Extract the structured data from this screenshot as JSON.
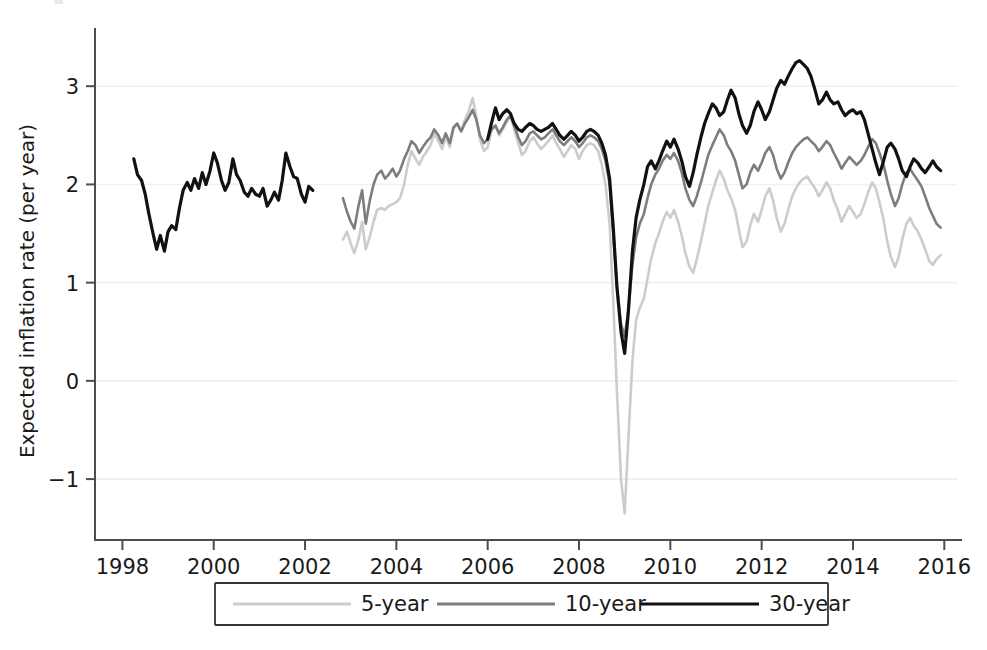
{
  "chart_data": {
    "type": "line",
    "title": "",
    "xlabel": "",
    "ylabel": "Expected inflation rate (per year)",
    "xlim": [
      1997.4,
      2016.3
    ],
    "ylim": [
      -1.62,
      3.45
    ],
    "xticks": [
      1998,
      2000,
      2002,
      2004,
      2006,
      2008,
      2010,
      2012,
      2014,
      2016
    ],
    "xticklabels": [
      "1998",
      "2000",
      "2002",
      "2004",
      "2006",
      "2008",
      "2010",
      "2012",
      "2014",
      "2016"
    ],
    "yticks": [
      -1,
      0,
      1,
      2,
      3
    ],
    "yticklabels": [
      "−1",
      "0",
      "1",
      "2",
      "3"
    ],
    "grid": "horizontal",
    "legend_position": "below-axes",
    "series": [
      {
        "name": "5-year",
        "color": "#cccccc",
        "width": 2.6,
        "x": [
          2002.83,
          2002.92,
          2003.0,
          2003.08,
          2003.17,
          2003.25,
          2003.33,
          2003.42,
          2003.5,
          2003.58,
          2003.67,
          2003.75,
          2003.83,
          2003.92,
          2004.0,
          2004.08,
          2004.17,
          2004.25,
          2004.33,
          2004.42,
          2004.5,
          2004.58,
          2004.67,
          2004.75,
          2004.83,
          2004.92,
          2005.0,
          2005.08,
          2005.17,
          2005.25,
          2005.33,
          2005.42,
          2005.5,
          2005.58,
          2005.67,
          2005.75,
          2005.83,
          2005.92,
          2006.0,
          2006.08,
          2006.17,
          2006.25,
          2006.33,
          2006.42,
          2006.5,
          2006.58,
          2006.67,
          2006.75,
          2006.83,
          2006.92,
          2007.0,
          2007.08,
          2007.17,
          2007.25,
          2007.33,
          2007.42,
          2007.5,
          2007.58,
          2007.67,
          2007.75,
          2007.83,
          2007.92,
          2008.0,
          2008.08,
          2008.17,
          2008.25,
          2008.33,
          2008.42,
          2008.5,
          2008.58,
          2008.67,
          2008.75,
          2008.83,
          2008.92,
          2009.0,
          2009.08,
          2009.17,
          2009.25,
          2009.33,
          2009.42,
          2009.5,
          2009.58,
          2009.67,
          2009.75,
          2009.83,
          2009.92,
          2010.0,
          2010.08,
          2010.17,
          2010.25,
          2010.33,
          2010.42,
          2010.5,
          2010.58,
          2010.67,
          2010.75,
          2010.83,
          2010.92,
          2011.0,
          2011.08,
          2011.17,
          2011.25,
          2011.33,
          2011.42,
          2011.5,
          2011.58,
          2011.67,
          2011.75,
          2011.83,
          2011.92,
          2012.0,
          2012.08,
          2012.17,
          2012.25,
          2012.33,
          2012.42,
          2012.5,
          2012.58,
          2012.67,
          2012.75,
          2012.83,
          2012.92,
          2013.0,
          2013.08,
          2013.17,
          2013.25,
          2013.33,
          2013.42,
          2013.5,
          2013.58,
          2013.67,
          2013.75,
          2013.83,
          2013.92,
          2014.0,
          2014.08,
          2014.17,
          2014.25,
          2014.33,
          2014.42,
          2014.5,
          2014.58,
          2014.67,
          2014.75,
          2014.83,
          2014.92,
          2015.0,
          2015.08,
          2015.17,
          2015.25,
          2015.33,
          2015.42,
          2015.5,
          2015.58,
          2015.67,
          2015.75,
          2015.83,
          2015.92
        ],
        "y": [
          1.44,
          1.52,
          1.4,
          1.3,
          1.44,
          1.62,
          1.34,
          1.47,
          1.62,
          1.74,
          1.76,
          1.74,
          1.78,
          1.8,
          1.82,
          1.86,
          2.0,
          2.2,
          2.34,
          2.26,
          2.2,
          2.28,
          2.34,
          2.4,
          2.52,
          2.44,
          2.36,
          2.48,
          2.38,
          2.56,
          2.62,
          2.54,
          2.66,
          2.74,
          2.88,
          2.7,
          2.46,
          2.34,
          2.38,
          2.54,
          2.6,
          2.5,
          2.56,
          2.64,
          2.7,
          2.56,
          2.42,
          2.3,
          2.34,
          2.44,
          2.48,
          2.42,
          2.36,
          2.4,
          2.44,
          2.5,
          2.42,
          2.36,
          2.28,
          2.34,
          2.4,
          2.36,
          2.26,
          2.34,
          2.4,
          2.42,
          2.4,
          2.34,
          2.2,
          2.0,
          1.6,
          0.8,
          -0.1,
          -1.0,
          -1.35,
          -0.6,
          0.2,
          0.62,
          0.74,
          0.84,
          1.04,
          1.24,
          1.4,
          1.5,
          1.62,
          1.72,
          1.66,
          1.74,
          1.62,
          1.48,
          1.3,
          1.16,
          1.1,
          1.24,
          1.42,
          1.6,
          1.78,
          1.92,
          2.04,
          2.14,
          2.06,
          1.94,
          1.86,
          1.74,
          1.54,
          1.36,
          1.42,
          1.58,
          1.7,
          1.62,
          1.74,
          1.88,
          1.96,
          1.84,
          1.66,
          1.52,
          1.6,
          1.74,
          1.88,
          1.96,
          2.02,
          2.06,
          2.08,
          2.02,
          1.96,
          1.88,
          1.94,
          2.02,
          1.96,
          1.84,
          1.74,
          1.62,
          1.7,
          1.78,
          1.72,
          1.66,
          1.7,
          1.8,
          1.92,
          2.02,
          1.96,
          1.82,
          1.64,
          1.42,
          1.26,
          1.16,
          1.26,
          1.44,
          1.6,
          1.66,
          1.58,
          1.52,
          1.44,
          1.34,
          1.22,
          1.18,
          1.24,
          1.28
        ]
      },
      {
        "name": "10-year",
        "color": "#7d7d7d",
        "width": 2.6,
        "x": [
          2002.83,
          2002.92,
          2003.0,
          2003.08,
          2003.17,
          2003.25,
          2003.33,
          2003.42,
          2003.5,
          2003.58,
          2003.67,
          2003.75,
          2003.83,
          2003.92,
          2004.0,
          2004.08,
          2004.17,
          2004.25,
          2004.33,
          2004.42,
          2004.5,
          2004.58,
          2004.67,
          2004.75,
          2004.83,
          2004.92,
          2005.0,
          2005.08,
          2005.17,
          2005.25,
          2005.33,
          2005.42,
          2005.5,
          2005.58,
          2005.67,
          2005.75,
          2005.83,
          2005.92,
          2006.0,
          2006.08,
          2006.17,
          2006.25,
          2006.33,
          2006.42,
          2006.5,
          2006.58,
          2006.67,
          2006.75,
          2006.83,
          2006.92,
          2007.0,
          2007.08,
          2007.17,
          2007.25,
          2007.33,
          2007.42,
          2007.5,
          2007.58,
          2007.67,
          2007.75,
          2007.83,
          2007.92,
          2008.0,
          2008.08,
          2008.17,
          2008.25,
          2008.33,
          2008.42,
          2008.5,
          2008.58,
          2008.67,
          2008.75,
          2008.83,
          2008.92,
          2009.0,
          2009.08,
          2009.17,
          2009.25,
          2009.33,
          2009.42,
          2009.5,
          2009.58,
          2009.67,
          2009.75,
          2009.83,
          2009.92,
          2010.0,
          2010.08,
          2010.17,
          2010.25,
          2010.33,
          2010.42,
          2010.5,
          2010.58,
          2010.67,
          2010.75,
          2010.83,
          2010.92,
          2011.0,
          2011.08,
          2011.17,
          2011.25,
          2011.33,
          2011.42,
          2011.5,
          2011.58,
          2011.67,
          2011.75,
          2011.83,
          2011.92,
          2012.0,
          2012.08,
          2012.17,
          2012.25,
          2012.33,
          2012.42,
          2012.5,
          2012.58,
          2012.67,
          2012.75,
          2012.83,
          2012.92,
          2013.0,
          2013.08,
          2013.17,
          2013.25,
          2013.33,
          2013.42,
          2013.5,
          2013.58,
          2013.67,
          2013.75,
          2013.83,
          2013.92,
          2014.0,
          2014.08,
          2014.17,
          2014.25,
          2014.33,
          2014.42,
          2014.5,
          2014.58,
          2014.67,
          2014.75,
          2014.83,
          2014.92,
          2015.0,
          2015.08,
          2015.17,
          2015.25,
          2015.33,
          2015.42,
          2015.5,
          2015.58,
          2015.67,
          2015.75,
          2015.83,
          2015.92
        ],
        "y": [
          1.86,
          1.72,
          1.62,
          1.55,
          1.78,
          1.94,
          1.6,
          1.84,
          2.0,
          2.1,
          2.14,
          2.06,
          2.1,
          2.16,
          2.08,
          2.14,
          2.26,
          2.34,
          2.44,
          2.4,
          2.32,
          2.38,
          2.44,
          2.48,
          2.56,
          2.5,
          2.42,
          2.52,
          2.42,
          2.58,
          2.62,
          2.54,
          2.62,
          2.68,
          2.76,
          2.66,
          2.5,
          2.42,
          2.46,
          2.56,
          2.6,
          2.52,
          2.58,
          2.66,
          2.7,
          2.6,
          2.48,
          2.4,
          2.44,
          2.52,
          2.54,
          2.5,
          2.46,
          2.48,
          2.52,
          2.56,
          2.5,
          2.44,
          2.4,
          2.44,
          2.48,
          2.44,
          2.38,
          2.42,
          2.48,
          2.5,
          2.48,
          2.44,
          2.36,
          2.24,
          2.0,
          1.5,
          0.96,
          0.58,
          0.45,
          0.72,
          1.18,
          1.46,
          1.6,
          1.7,
          1.86,
          2.0,
          2.1,
          2.16,
          2.24,
          2.3,
          2.26,
          2.32,
          2.24,
          2.12,
          1.96,
          1.84,
          1.78,
          1.88,
          2.02,
          2.16,
          2.3,
          2.4,
          2.48,
          2.56,
          2.5,
          2.4,
          2.34,
          2.24,
          2.1,
          1.96,
          2.0,
          2.12,
          2.2,
          2.14,
          2.22,
          2.32,
          2.38,
          2.3,
          2.16,
          2.06,
          2.12,
          2.22,
          2.32,
          2.38,
          2.42,
          2.46,
          2.48,
          2.44,
          2.4,
          2.34,
          2.38,
          2.44,
          2.4,
          2.32,
          2.24,
          2.16,
          2.22,
          2.28,
          2.24,
          2.2,
          2.24,
          2.3,
          2.38,
          2.46,
          2.42,
          2.32,
          2.2,
          2.04,
          1.9,
          1.78,
          1.86,
          2.0,
          2.12,
          2.16,
          2.1,
          2.04,
          1.98,
          1.88,
          1.76,
          1.68,
          1.6,
          1.56
        ]
      },
      {
        "name": "30-year",
        "color": "#111111",
        "width": 3.2,
        "segments": [
          {
            "x": [
              1998.25,
              1998.33,
              1998.42,
              1998.5,
              1998.58,
              1998.67,
              1998.75,
              1998.83,
              1998.92,
              1999.0,
              1999.08,
              1999.17,
              1999.25,
              1999.33,
              1999.42,
              1999.5,
              1999.58,
              1999.67,
              1999.75,
              1999.83,
              1999.92,
              2000.0,
              2000.08,
              2000.17,
              2000.25,
              2000.33,
              2000.42,
              2000.5,
              2000.58,
              2000.67,
              2000.75,
              2000.83,
              2000.92,
              2001.0,
              2001.08,
              2001.17,
              2001.25,
              2001.33,
              2001.42,
              2001.5,
              2001.58,
              2001.67,
              2001.75,
              2001.83,
              2001.92,
              2002.0,
              2002.08,
              2002.17
            ],
            "y": [
              2.26,
              2.1,
              2.04,
              1.9,
              1.7,
              1.5,
              1.34,
              1.48,
              1.32,
              1.52,
              1.58,
              1.54,
              1.76,
              1.94,
              2.02,
              1.94,
              2.06,
              1.96,
              2.12,
              2.0,
              2.14,
              2.32,
              2.22,
              2.04,
              1.94,
              2.02,
              2.26,
              2.1,
              2.04,
              1.92,
              1.88,
              1.96,
              1.9,
              1.88,
              1.96,
              1.78,
              1.84,
              1.92,
              1.84,
              2.04,
              2.32,
              2.18,
              2.08,
              2.06,
              1.9,
              1.82,
              1.98,
              1.94
            ]
          },
          {
            "x": [
              2006.0,
              2006.08,
              2006.17,
              2006.25,
              2006.33,
              2006.42,
              2006.5,
              2006.58,
              2006.67,
              2006.75,
              2006.83,
              2006.92,
              2007.0,
              2007.08,
              2007.17,
              2007.25,
              2007.33,
              2007.42,
              2007.5,
              2007.58,
              2007.67,
              2007.75,
              2007.83,
              2007.92,
              2008.0,
              2008.08,
              2008.17,
              2008.25,
              2008.33,
              2008.42,
              2008.5,
              2008.58,
              2008.67,
              2008.75,
              2008.83,
              2008.92,
              2009.0,
              2009.08,
              2009.17,
              2009.25,
              2009.33,
              2009.42,
              2009.5,
              2009.58,
              2009.67,
              2009.75,
              2009.83,
              2009.92,
              2010.0,
              2010.08,
              2010.17,
              2010.25,
              2010.33,
              2010.42,
              2010.5,
              2010.58,
              2010.67,
              2010.75,
              2010.83,
              2010.92,
              2011.0,
              2011.08,
              2011.17,
              2011.25,
              2011.33,
              2011.42,
              2011.5,
              2011.58,
              2011.67,
              2011.75,
              2011.83,
              2011.92,
              2012.0,
              2012.08,
              2012.17,
              2012.25,
              2012.33,
              2012.42,
              2012.5,
              2012.58,
              2012.67,
              2012.75,
              2012.83,
              2012.92,
              2013.0,
              2013.08,
              2013.17,
              2013.25,
              2013.33,
              2013.42,
              2013.5,
              2013.58,
              2013.67,
              2013.75,
              2013.83,
              2013.92,
              2014.0,
              2014.08,
              2014.17,
              2014.25,
              2014.33,
              2014.42,
              2014.5,
              2014.58,
              2014.67,
              2014.75,
              2014.83,
              2014.92,
              2015.0,
              2015.08,
              2015.17,
              2015.25,
              2015.33,
              2015.42,
              2015.5,
              2015.58,
              2015.67,
              2015.75,
              2015.83,
              2015.92
            ],
            "y": [
              2.46,
              2.62,
              2.78,
              2.66,
              2.72,
              2.76,
              2.72,
              2.62,
              2.56,
              2.54,
              2.58,
              2.62,
              2.6,
              2.56,
              2.54,
              2.56,
              2.58,
              2.62,
              2.56,
              2.5,
              2.46,
              2.5,
              2.54,
              2.5,
              2.44,
              2.48,
              2.54,
              2.56,
              2.54,
              2.5,
              2.42,
              2.3,
              2.06,
              1.56,
              0.96,
              0.5,
              0.28,
              0.7,
              1.32,
              1.66,
              1.84,
              2.0,
              2.18,
              2.24,
              2.16,
              2.24,
              2.34,
              2.44,
              2.38,
              2.46,
              2.36,
              2.24,
              2.08,
              1.98,
              2.12,
              2.3,
              2.48,
              2.62,
              2.72,
              2.82,
              2.78,
              2.7,
              2.74,
              2.86,
              2.96,
              2.88,
              2.72,
              2.6,
              2.52,
              2.6,
              2.74,
              2.84,
              2.76,
              2.66,
              2.74,
              2.86,
              2.98,
              3.06,
              3.02,
              3.1,
              3.18,
              3.24,
              3.26,
              3.22,
              3.18,
              3.1,
              2.96,
              2.82,
              2.86,
              2.94,
              2.86,
              2.82,
              2.84,
              2.76,
              2.7,
              2.74,
              2.76,
              2.72,
              2.74,
              2.66,
              2.52,
              2.36,
              2.22,
              2.1,
              2.24,
              2.38,
              2.42,
              2.36,
              2.26,
              2.14,
              2.08,
              2.18,
              2.26,
              2.22,
              2.16,
              2.12,
              2.18,
              2.24,
              2.18,
              2.14
            ]
          }
        ]
      }
    ]
  },
  "legend": {
    "entries": [
      {
        "label": "5-year",
        "color": "#cccccc",
        "width": 3
      },
      {
        "label": "10-year",
        "color": "#7d7d7d",
        "width": 3
      },
      {
        "label": "30-year",
        "color": "#111111",
        "width": 3.6
      }
    ]
  }
}
